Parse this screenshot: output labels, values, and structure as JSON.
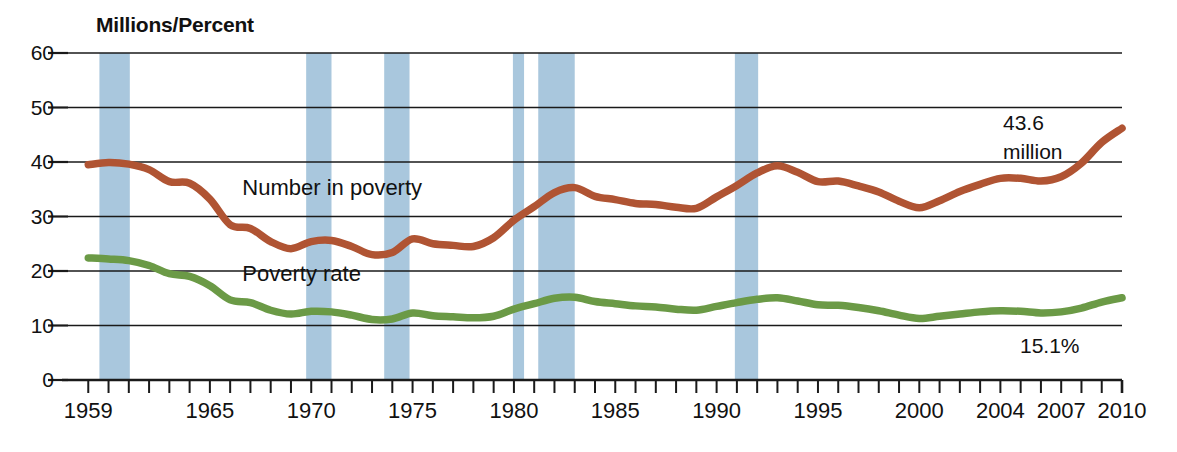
{
  "chart_data": {
    "type": "line",
    "title": "Millions/Percent",
    "xlabel": "",
    "ylabel": "Millions/Percent",
    "ylim": [
      0,
      60
    ],
    "ytick_labels": [
      "0",
      "10",
      "20",
      "30",
      "40",
      "50",
      "60"
    ],
    "yticks": [
      0,
      10,
      20,
      30,
      40,
      50,
      60
    ],
    "grid": true,
    "legend_position": "inline",
    "xlim": [
      1958,
      2010
    ],
    "xtick_labels": [
      "1959",
      "1965",
      "1970",
      "1975",
      "1980",
      "1985",
      "1990",
      "1995",
      "2000",
      "2004",
      "2007",
      "2010"
    ],
    "xticks": [
      1959,
      1965,
      1970,
      1975,
      1980,
      1985,
      1990,
      1995,
      2000,
      2004,
      2007,
      2010
    ],
    "x": [
      1959,
      1960,
      1961,
      1962,
      1963,
      1964,
      1965,
      1966,
      1967,
      1968,
      1969,
      1970,
      1971,
      1972,
      1973,
      1974,
      1975,
      1976,
      1977,
      1978,
      1979,
      1980,
      1981,
      1982,
      1983,
      1984,
      1985,
      1986,
      1987,
      1988,
      1989,
      1990,
      1991,
      1992,
      1993,
      1994,
      1995,
      1996,
      1997,
      1998,
      1999,
      2000,
      2001,
      2002,
      2003,
      2004,
      2005,
      2006,
      2007,
      2008,
      2009,
      2010
    ],
    "series": [
      {
        "name": "Number in poverty",
        "unit": "millions",
        "color": "#b05433",
        "label_x": 1966.6,
        "label_y": 35.0,
        "end_annotation": [
          "43.6",
          "million"
        ],
        "values": [
          39.5,
          39.9,
          39.6,
          38.6,
          36.4,
          36.1,
          33.2,
          28.5,
          27.8,
          25.4,
          24.1,
          25.4,
          25.6,
          24.5,
          23.0,
          23.4,
          25.9,
          25.0,
          24.7,
          24.5,
          26.1,
          29.3,
          31.8,
          34.4,
          35.3,
          33.7,
          33.1,
          32.4,
          32.2,
          31.7,
          31.5,
          33.6,
          35.7,
          38.0,
          39.3,
          38.1,
          36.4,
          36.5,
          35.6,
          34.5,
          32.8,
          31.6,
          32.9,
          34.6,
          35.9,
          37.0,
          37.0,
          36.5,
          37.3,
          39.8,
          43.6,
          46.2
        ]
      },
      {
        "name": "Poverty rate",
        "unit": "percent",
        "color": "#6b9a46",
        "label_x": 1966.6,
        "label_y": 19.2,
        "end_annotation": [
          "15.1%"
        ],
        "values": [
          22.4,
          22.2,
          21.9,
          21.0,
          19.5,
          19.0,
          17.3,
          14.7,
          14.2,
          12.8,
          12.1,
          12.6,
          12.5,
          11.9,
          11.1,
          11.2,
          12.3,
          11.8,
          11.6,
          11.4,
          11.7,
          13.0,
          14.0,
          15.0,
          15.2,
          14.4,
          14.0,
          13.6,
          13.4,
          13.0,
          12.8,
          13.5,
          14.2,
          14.8,
          15.1,
          14.5,
          13.8,
          13.7,
          13.3,
          12.7,
          11.9,
          11.3,
          11.7,
          12.1,
          12.5,
          12.7,
          12.6,
          12.3,
          12.5,
          13.2,
          14.3,
          15.1
        ]
      }
    ],
    "shaded_bands": {
      "name": "recession-bands",
      "color": "#a9c7dd",
      "ranges": [
        [
          1959.55,
          1961.05
        ],
        [
          1969.75,
          1971.0
        ],
        [
          1973.6,
          1974.85
        ],
        [
          1979.95,
          1980.5
        ],
        [
          1981.2,
          1983.0
        ],
        [
          1990.9,
          1992.05
        ]
      ]
    }
  }
}
